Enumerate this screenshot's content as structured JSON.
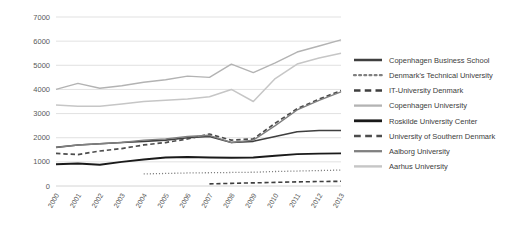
{
  "chart_data": {
    "type": "line",
    "title": "",
    "xlabel": "",
    "ylabel": "",
    "categories": [
      "2000",
      "2001",
      "2002",
      "2003",
      "2004",
      "2005",
      "2006",
      "2007",
      "2008",
      "2009",
      "2010",
      "2011",
      "2012",
      "2013"
    ],
    "ylim": [
      0,
      7000
    ],
    "yticks": [
      0,
      1000,
      2000,
      3000,
      4000,
      5000,
      6000,
      7000
    ],
    "grid": true,
    "legend_position": "right",
    "series": [
      {
        "name": "Copenhagen Business School",
        "style": "solid",
        "color": "#3f3f3f",
        "width": 1.6,
        "values": [
          1600,
          1700,
          1750,
          1800,
          1850,
          1900,
          2000,
          2050,
          1800,
          1850,
          2050,
          2250,
          2300,
          2300
        ]
      },
      {
        "name": "Denmark's Technical University",
        "style": "dotted",
        "color": "#7f7f7f",
        "width": 1.3,
        "values": [
          null,
          null,
          null,
          null,
          500,
          520,
          540,
          550,
          560,
          570,
          600,
          620,
          640,
          660
        ]
      },
      {
        "name": "IT-University Denmark",
        "style": "dashed",
        "color": "#3f3f3f",
        "width": 1.6,
        "values": [
          null,
          null,
          null,
          null,
          null,
          null,
          null,
          90,
          110,
          130,
          150,
          170,
          185,
          195
        ]
      },
      {
        "name": "Copenhagen University",
        "style": "solid",
        "color": "#b3b3b3",
        "width": 1.4,
        "values": [
          4000,
          4250,
          4050,
          4150,
          4300,
          4400,
          4550,
          4500,
          5050,
          4700,
          5100,
          5550,
          5800,
          6050
        ]
      },
      {
        "name": "Roskilde University Center",
        "style": "solid",
        "color": "#1a1a1a",
        "width": 1.9,
        "values": [
          900,
          930,
          880,
          1000,
          1100,
          1180,
          1200,
          1180,
          1170,
          1180,
          1250,
          1320,
          1340,
          1350
        ]
      },
      {
        "name": "University of Southern Denmark",
        "style": "dashed",
        "color": "#4d4d4d",
        "width": 1.7,
        "values": [
          1350,
          1300,
          1450,
          1550,
          1700,
          1800,
          1950,
          2150,
          1900,
          1950,
          2600,
          3200,
          3600,
          3950
        ]
      },
      {
        "name": "Aalborg University",
        "style": "solid",
        "color": "#808080",
        "width": 1.4,
        "values": [
          1600,
          1700,
          1750,
          1800,
          1900,
          1950,
          2050,
          2100,
          1800,
          1900,
          2500,
          3150,
          3550,
          3900
        ]
      },
      {
        "name": "Aarhus University",
        "style": "solid",
        "color": "#c6c6c6",
        "width": 1.5,
        "values": [
          3350,
          3300,
          3300,
          3400,
          3500,
          3550,
          3600,
          3700,
          4000,
          3500,
          4450,
          5050,
          5300,
          5500
        ]
      }
    ]
  },
  "legend": {
    "items": [
      {
        "label": "Copenhagen Business School"
      },
      {
        "label": "Denmark's Technical University"
      },
      {
        "label": "IT-University Denmark"
      },
      {
        "label": "Copenhagen University"
      },
      {
        "label": "Roskilde University Center"
      },
      {
        "label": "University of Southern Denmark"
      },
      {
        "label": "Aalborg University"
      },
      {
        "label": "Aarhus University"
      }
    ]
  }
}
